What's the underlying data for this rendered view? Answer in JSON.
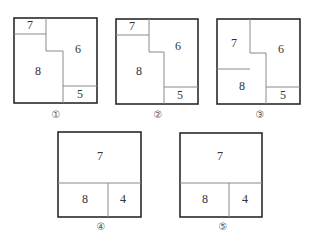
{
  "figures": [
    {
      "caption": "①",
      "regions": [
        {
          "label": "7",
          "x": 30,
          "y": 26
        },
        {
          "label": "6",
          "x": 78,
          "y": 50
        },
        {
          "label": "8",
          "x": 38,
          "y": 72
        },
        {
          "label": "5",
          "x": 80,
          "y": 95
        }
      ]
    },
    {
      "caption": "②",
      "regions": [
        {
          "label": "7",
          "x": 132,
          "y": 27
        },
        {
          "label": "6",
          "x": 178,
          "y": 47
        },
        {
          "label": "8",
          "x": 139,
          "y": 72
        },
        {
          "label": "5",
          "x": 180,
          "y": 96
        }
      ]
    },
    {
      "caption": "③",
      "regions": [
        {
          "label": "7",
          "x": 234,
          "y": 44
        },
        {
          "label": "6",
          "x": 281,
          "y": 50
        },
        {
          "label": "8",
          "x": 242,
          "y": 87
        },
        {
          "label": "5",
          "x": 283,
          "y": 96
        }
      ]
    },
    {
      "caption": "④",
      "regions": [
        {
          "label": "7",
          "x": 100,
          "y": 157
        },
        {
          "label": "8",
          "x": 85,
          "y": 200
        },
        {
          "label": "4",
          "x": 123,
          "y": 200
        }
      ]
    },
    {
      "caption": "⑤",
      "regions": [
        {
          "label": "7",
          "x": 220,
          "y": 157
        },
        {
          "label": "8",
          "x": 205,
          "y": 200
        },
        {
          "label": "4",
          "x": 245,
          "y": 200
        }
      ]
    }
  ]
}
